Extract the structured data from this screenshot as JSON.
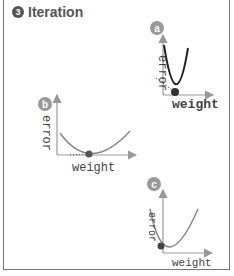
{
  "title": {
    "number": "3",
    "label": "Iteration"
  },
  "panels": [
    {
      "badge": "a",
      "xlabel": "weight",
      "ylabel": "error"
    },
    {
      "badge": "b",
      "xlabel": "weight",
      "ylabel": "error"
    },
    {
      "badge": "c",
      "xlabel": "weight",
      "ylabel": "error"
    }
  ],
  "colors": {
    "badge": "#999999",
    "curve_a": "#222222",
    "curve_bc": "#888888",
    "axis": "#999999",
    "point": "#555555"
  }
}
